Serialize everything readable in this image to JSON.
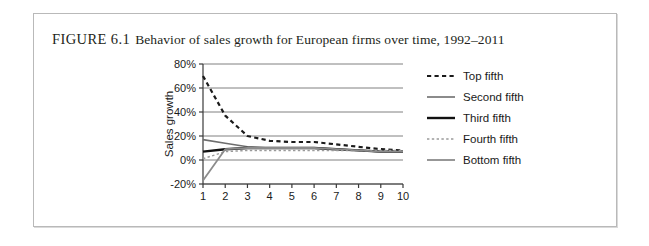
{
  "figure": {
    "label": "FIGURE 6.1",
    "caption": "Behavior of sales growth for European firms over time, 1992–2011"
  },
  "chart_data": {
    "type": "line",
    "title": "Behavior of sales growth for European firms over time, 1992–2011",
    "xlabel": "Year",
    "ylabel": "Sales growth",
    "x": [
      1,
      2,
      3,
      4,
      5,
      6,
      7,
      8,
      9,
      10
    ],
    "categories": [
      "1",
      "2",
      "3",
      "4",
      "5",
      "6",
      "7",
      "8",
      "9",
      "10"
    ],
    "xlim": [
      1,
      10
    ],
    "ylim": [
      -20,
      80
    ],
    "yticks": [
      -20,
      0,
      20,
      40,
      60,
      80
    ],
    "ytick_labels": [
      "-20%",
      "0%",
      "20%",
      "40%",
      "60%",
      "80%"
    ],
    "xticks": [
      1,
      2,
      3,
      4,
      5,
      6,
      7,
      8,
      9,
      10
    ],
    "grid": "horizontal",
    "legend_position": "right",
    "units": "percent",
    "series": [
      {
        "name": "Top fifth",
        "values": [
          70,
          37,
          20,
          16,
          15,
          15,
          13,
          11,
          9,
          8
        ],
        "color": "#1a1a1a",
        "style": "dashed",
        "width": 2.2
      },
      {
        "name": "Second fifth",
        "values": [
          17,
          14,
          11,
          10,
          10,
          10,
          9,
          8,
          7,
          7
        ],
        "color": "#6e6e6e",
        "style": "solid",
        "width": 1.6
      },
      {
        "name": "Third fifth",
        "values": [
          7,
          9,
          10,
          10,
          10,
          10,
          9,
          8,
          7,
          7
        ],
        "color": "#111111",
        "style": "solid",
        "width": 2.4
      },
      {
        "name": "Fourth fifth",
        "values": [
          1,
          7,
          8,
          8,
          8,
          8,
          8,
          8,
          8,
          8
        ],
        "color": "#9a9a9a",
        "style": "dotted",
        "width": 1.5
      },
      {
        "name": "Bottom fifth",
        "values": [
          -17,
          9,
          10,
          10,
          10,
          10,
          9,
          8,
          7,
          7
        ],
        "color": "#8c8c8c",
        "style": "solid",
        "width": 1.8
      }
    ]
  },
  "colors": {
    "frame_border": "#b9b9b9",
    "gridline": "#808080",
    "axis": "#3a3a3a",
    "text": "#1a1a1a",
    "caption": "#231f20",
    "background": "#ffffff"
  }
}
